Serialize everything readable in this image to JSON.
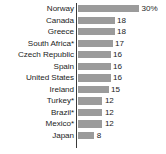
{
  "chart_data": {
    "type": "bar",
    "orientation": "horizontal",
    "title": "",
    "subtitle": "",
    "xlabel": "",
    "ylabel": "",
    "grid": false,
    "legend": null,
    "axis_visible": {
      "category_spine": true,
      "value_axis": false
    },
    "value_unit": "%",
    "xlim": [
      0,
      30
    ],
    "categories": [
      "Norway",
      "Canada",
      "Greece",
      "South Africa*",
      "Czech Republic",
      "Spain",
      "United States",
      "Ireland",
      "Turkey*",
      "Brazil*",
      "Mexico*",
      "Japan"
    ],
    "values": [
      30,
      18,
      18,
      17,
      16,
      16,
      16,
      15,
      12,
      12,
      12,
      8
    ],
    "value_labels": [
      "30%",
      "18",
      "18",
      "17",
      "16",
      "16",
      "16",
      "15",
      "12",
      "12",
      "12",
      "8"
    ],
    "colors": {
      "bar": "#9b9b9b",
      "axis": "#3a3a3a",
      "text": "#1d1d1d",
      "background": "#ffffff"
    },
    "rows": [
      {
        "category": "Norway",
        "value": 30,
        "value_label": "30%"
      },
      {
        "category": "Canada",
        "value": 18,
        "value_label": "18"
      },
      {
        "category": "Greece",
        "value": 18,
        "value_label": "18"
      },
      {
        "category": "South Africa*",
        "value": 17,
        "value_label": "17"
      },
      {
        "category": "Czech Republic",
        "value": 16,
        "value_label": "16"
      },
      {
        "category": "Spain",
        "value": 16,
        "value_label": "16"
      },
      {
        "category": "United States",
        "value": 16,
        "value_label": "16"
      },
      {
        "category": "Ireland",
        "value": 15,
        "value_label": "15"
      },
      {
        "category": "Turkey*",
        "value": 12,
        "value_label": "12"
      },
      {
        "category": "Brazil*",
        "value": 12,
        "value_label": "12"
      },
      {
        "category": "Mexico*",
        "value": 12,
        "value_label": "12"
      },
      {
        "category": "Japan",
        "value": 8,
        "value_label": "8"
      }
    ]
  }
}
